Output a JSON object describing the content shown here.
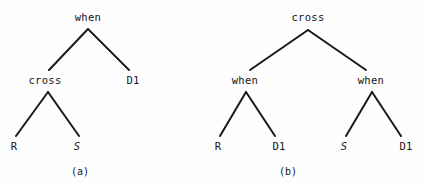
{
  "figure": {
    "background_color": "#fefefe",
    "stroke_color": "#1a1a1a",
    "text_color": "#141414",
    "width": 423,
    "height": 189
  },
  "panels": [
    {
      "id": "a",
      "caption": "(a)",
      "caption_x": 80,
      "caption_y": 172,
      "nodes": [
        {
          "name": "root",
          "label": "when",
          "x": 88,
          "y": 17,
          "italic": false
        },
        {
          "name": "left-child",
          "label": "cross",
          "x": 45,
          "y": 80,
          "italic": false
        },
        {
          "name": "right-child",
          "label": "D1",
          "x": 133,
          "y": 80,
          "italic": false
        },
        {
          "name": "leaf-left",
          "label": "R",
          "x": 14,
          "y": 146,
          "italic": false
        },
        {
          "name": "leaf-right",
          "label": "S",
          "x": 77,
          "y": 146,
          "italic": true
        }
      ],
      "edges": [
        {
          "name": "root-to-cross",
          "x1": 88,
          "y1": 29,
          "x2": 49,
          "y2": 70
        },
        {
          "name": "root-to-d1",
          "x1": 88,
          "y1": 29,
          "x2": 129,
          "y2": 70
        },
        {
          "name": "cross-to-r",
          "x1": 48,
          "y1": 92,
          "x2": 16,
          "y2": 136
        },
        {
          "name": "cross-to-s",
          "x1": 48,
          "y1": 92,
          "x2": 79,
          "y2": 136
        }
      ]
    },
    {
      "id": "b",
      "caption": "(b)",
      "caption_x": 288,
      "caption_y": 172,
      "nodes": [
        {
          "name": "root",
          "label": "cross",
          "x": 308,
          "y": 17,
          "italic": false
        },
        {
          "name": "left-when",
          "label": "when",
          "x": 245,
          "y": 80,
          "italic": false
        },
        {
          "name": "right-when",
          "label": "when",
          "x": 371,
          "y": 80,
          "italic": false
        },
        {
          "name": "leaf-left-r",
          "label": "R",
          "x": 218,
          "y": 146,
          "italic": false
        },
        {
          "name": "leaf-left-d1",
          "label": "D1",
          "x": 279,
          "y": 146,
          "italic": false
        },
        {
          "name": "leaf-right-s",
          "label": "S",
          "x": 344,
          "y": 146,
          "italic": true
        },
        {
          "name": "leaf-right-d1",
          "label": "D1",
          "x": 406,
          "y": 146,
          "italic": false
        }
      ],
      "edges": [
        {
          "name": "root-to-left-when",
          "x1": 308,
          "y1": 30,
          "x2": 250,
          "y2": 70
        },
        {
          "name": "root-to-right-when",
          "x1": 308,
          "y1": 30,
          "x2": 366,
          "y2": 70
        },
        {
          "name": "left-when-to-r",
          "x1": 246,
          "y1": 92,
          "x2": 220,
          "y2": 136
        },
        {
          "name": "left-when-to-d1",
          "x1": 246,
          "y1": 92,
          "x2": 275,
          "y2": 136
        },
        {
          "name": "right-when-to-s",
          "x1": 372,
          "y1": 92,
          "x2": 346,
          "y2": 136
        },
        {
          "name": "right-when-to-d1",
          "x1": 372,
          "y1": 92,
          "x2": 401,
          "y2": 136
        }
      ]
    }
  ]
}
